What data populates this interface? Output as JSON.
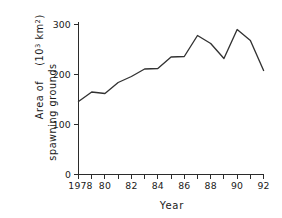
{
  "chart_data": {
    "type": "line",
    "title": "",
    "xlabel": "Year",
    "ylabel_line1": "Area of",
    "ylabel_line2": "spawning grounds",
    "ylabel_units_base": "(10",
    "ylabel_units_exp1": "3",
    "ylabel_units_mid": " km",
    "ylabel_units_exp2": "2",
    "ylabel_units_close": ")",
    "ylabel_full": "Area of spawning grounds (10^3 km^2)",
    "x": [
      1978,
      1979,
      1980,
      1981,
      1982,
      1983,
      1984,
      1985,
      1986,
      1987,
      1988,
      1989,
      1990,
      1991,
      1992
    ],
    "values": [
      146,
      165,
      162,
      184,
      196,
      211,
      212,
      235,
      236,
      278,
      262,
      232,
      290,
      268,
      208
    ],
    "xlim": [
      1978,
      1992
    ],
    "ylim": [
      0,
      300
    ],
    "yticks": [
      0,
      100,
      200,
      300
    ],
    "ytick_labels": [
      "0",
      "100",
      "200",
      "300"
    ],
    "xticks": [
      1978,
      1979,
      1980,
      1981,
      1982,
      1983,
      1984,
      1985,
      1986,
      1987,
      1988,
      1989,
      1990,
      1991,
      1992
    ],
    "xtick_labels_shown": [
      {
        "x": 1978,
        "label": "1978"
      },
      {
        "x": 1980,
        "label": "80"
      },
      {
        "x": 1982,
        "label": "82"
      },
      {
        "x": 1984,
        "label": "84"
      },
      {
        "x": 1986,
        "label": "86"
      },
      {
        "x": 1988,
        "label": "88"
      },
      {
        "x": 1990,
        "label": "90"
      },
      {
        "x": 1992,
        "label": "92"
      }
    ],
    "grid": false,
    "legend": false,
    "line_color": "#323232",
    "axis_color": "#2b2b2b",
    "background_color": "#ffffff"
  }
}
